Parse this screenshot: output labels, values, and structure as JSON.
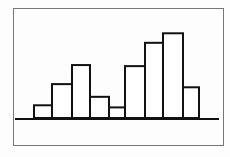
{
  "chart_data": {
    "type": "bar",
    "title": "",
    "xlabel": "",
    "ylabel": "",
    "categories": [
      "1",
      "2",
      "3",
      "4",
      "5",
      "6",
      "7",
      "8",
      "9"
    ],
    "values": [
      1.2,
      3.2,
      5.0,
      2.0,
      1.0,
      4.9,
      7.1,
      8.0,
      2.9
    ],
    "ylim": [
      0,
      8.5
    ],
    "grid": false,
    "legend": "none",
    "bar_fill": "#ffffff",
    "bar_stroke": "#111111",
    "frame_stroke": "#777777"
  }
}
